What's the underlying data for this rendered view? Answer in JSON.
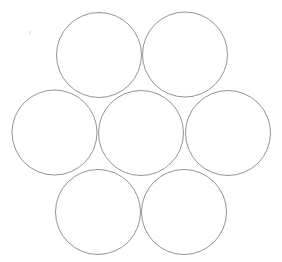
{
  "figure": {
    "width": 282,
    "height": 262,
    "background_color": "#ffffff",
    "stroke_color": "#808086",
    "stroke_width": 0.85,
    "fill": "none",
    "circle_count": 7,
    "arrangement": "hexagonal-close-packing",
    "radius": 42.5
  },
  "chart_data": {
    "type": "scatter",
    "subtitle": "",
    "xlabel": "",
    "ylabel": "",
    "xlim": [
      0,
      282
    ],
    "ylim": [
      0,
      262
    ],
    "grid": false,
    "legend": "none",
    "annotations": [],
    "shape": "circle",
    "common_radius": 42.5,
    "series": [
      {
        "name": "circles",
        "points": [
          {
            "id": "center",
            "label": "Center circle",
            "cx": 141.0,
            "cy": 133.0,
            "r": 42.5
          },
          {
            "id": "top-left",
            "label": "Top-left circle",
            "cx": 99.0,
            "cy": 55.0,
            "r": 42.5
          },
          {
            "id": "top-right",
            "label": "Top-right circle",
            "cx": 185.0,
            "cy": 54.5,
            "r": 42.5
          },
          {
            "id": "left",
            "label": "Left circle",
            "cx": 54.5,
            "cy": 132.5,
            "r": 42.5
          },
          {
            "id": "right",
            "label": "Right circle",
            "cx": 228.0,
            "cy": 133.0,
            "r": 42.5
          },
          {
            "id": "bottom-left",
            "label": "Bottom-left circle",
            "cx": 98.0,
            "cy": 212.0,
            "r": 42.5
          },
          {
            "id": "bottom-right",
            "label": "Bottom-right circle",
            "cx": 184.0,
            "cy": 212.0,
            "r": 42.5
          }
        ]
      }
    ]
  },
  "artifacts": [
    {
      "id": "speck-1",
      "x": 29,
      "y": 31,
      "label": "faint scan speck"
    }
  ]
}
